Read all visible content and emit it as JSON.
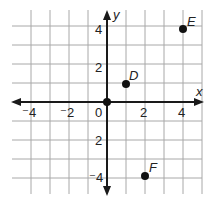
{
  "diagram": {
    "type": "coordinate-plane",
    "axes": {
      "x_label": "x",
      "y_label": "y",
      "x_range": [
        -5,
        5
      ],
      "y_range": [
        -5,
        5
      ],
      "grid": true,
      "grid_step": 1
    },
    "x_ticks": [
      {
        "value": -4,
        "label": "⁻4"
      },
      {
        "value": -2,
        "label": "⁻2"
      },
      {
        "value": 0,
        "label": "0"
      },
      {
        "value": 2,
        "label": "2"
      },
      {
        "value": 4,
        "label": "4"
      }
    ],
    "y_ticks": [
      {
        "value": 4,
        "label": "4"
      },
      {
        "value": 2,
        "label": "2"
      },
      {
        "value": -2,
        "label": "2"
      },
      {
        "value": -4,
        "label": "⁻4"
      }
    ],
    "points": [
      {
        "name": "origin",
        "label": "",
        "x": 0,
        "y": 0
      },
      {
        "name": "D",
        "label": "D",
        "x": 1,
        "y": 1
      },
      {
        "name": "E",
        "label": "E",
        "x": 4,
        "y": 4
      },
      {
        "name": "F",
        "label": "F",
        "x": 2,
        "y": -4
      }
    ],
    "colors": {
      "grid": "#a8a8a8",
      "axis": "#1a1a1a",
      "point": "#111111"
    }
  }
}
